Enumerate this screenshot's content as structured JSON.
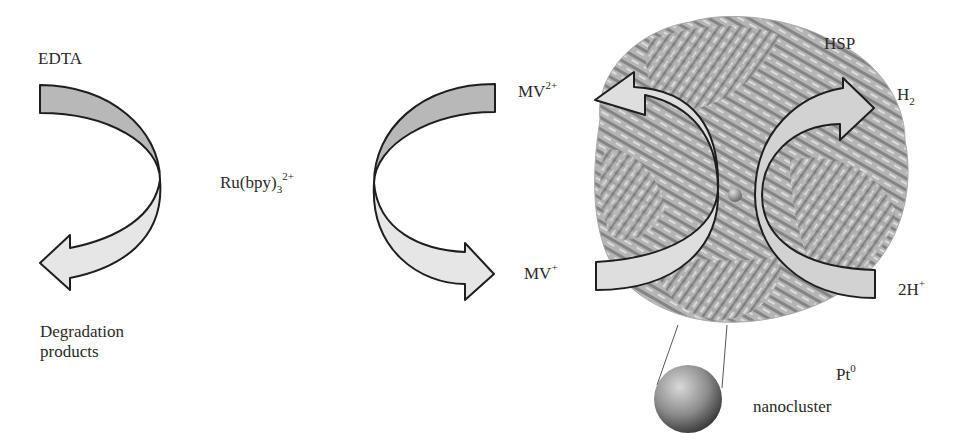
{
  "diagram": {
    "type": "reaction-scheme",
    "labels": {
      "edta": "EDTA",
      "degradation_line1": "Degradation",
      "degradation_line2": "products",
      "ru_main": "Ru(bpy)",
      "ru_sub": "3",
      "ru_sup": "2+",
      "mv2_main": "MV",
      "mv2_sup": "2+",
      "mv1_main": "MV",
      "mv1_sup": "+",
      "hsp": "HSP",
      "h2_main": "H",
      "h2_sub": "2",
      "twoh_main": "2H",
      "twoh_sup": "+",
      "pt_main": "Pt",
      "pt_sup": "0",
      "nanocluster": "nanocluster"
    },
    "colors": {
      "arrow_dark_fill": "#b8b8b8",
      "arrow_light_fill": "#e6e6e6",
      "arrow_stroke": "#1e1e1e",
      "protein_gray": "#8a8a8a"
    },
    "flows": [
      {
        "from": "EDTA",
        "to": "Degradation products"
      },
      {
        "from": "MV2+",
        "to": "MV+",
        "mediator": "Ru(bpy)3 2+"
      },
      {
        "from": "MV+",
        "to": "MV2+",
        "via": "HSP"
      },
      {
        "from": "2H+",
        "to": "H2",
        "via": "Pt0 nanocluster"
      }
    ]
  }
}
